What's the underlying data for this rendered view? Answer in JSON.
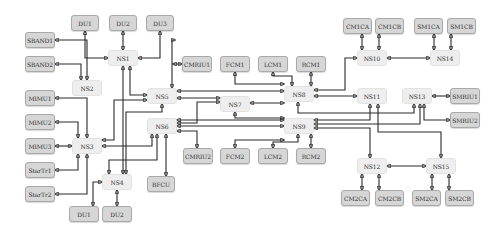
{
  "diagram": {
    "type": "network-topology",
    "nodes": {
      "du1_top": {
        "label": "DU1",
        "kind": "device",
        "x": 71,
        "y": 15,
        "w": 28,
        "h": 16
      },
      "du2_top": {
        "label": "DU2",
        "kind": "device",
        "x": 109,
        "y": 15,
        "w": 28,
        "h": 16
      },
      "du3": {
        "label": "DU3",
        "kind": "device",
        "x": 146,
        "y": 15,
        "w": 28,
        "h": 16
      },
      "sband1": {
        "label": "SBAND1",
        "kind": "device",
        "x": 25,
        "y": 32,
        "w": 30,
        "h": 16
      },
      "sband2": {
        "label": "SBAND2",
        "kind": "device",
        "x": 25,
        "y": 56,
        "w": 30,
        "h": 16
      },
      "ns1": {
        "label": "NS1",
        "kind": "switch",
        "x": 108,
        "y": 50,
        "w": 30,
        "h": 16
      },
      "ns2": {
        "label": "NS2",
        "kind": "switch",
        "x": 72,
        "y": 80,
        "w": 30,
        "h": 16
      },
      "mimu1": {
        "label": "MIMU1",
        "kind": "device",
        "x": 25,
        "y": 90,
        "w": 30,
        "h": 16
      },
      "mimu2": {
        "label": "MIMU2",
        "kind": "device",
        "x": 25,
        "y": 114,
        "w": 30,
        "h": 16
      },
      "mimu3": {
        "label": "MIMU3",
        "kind": "device",
        "x": 25,
        "y": 138,
        "w": 30,
        "h": 16
      },
      "startr1": {
        "label": "StarTr1",
        "kind": "device",
        "x": 25,
        "y": 162,
        "w": 30,
        "h": 16
      },
      "startr2": {
        "label": "StarTr2",
        "kind": "device",
        "x": 25,
        "y": 186,
        "w": 30,
        "h": 16
      },
      "ns3": {
        "label": "NS3",
        "kind": "switch",
        "x": 72,
        "y": 138,
        "w": 30,
        "h": 16
      },
      "ns4": {
        "label": "NS4",
        "kind": "switch",
        "x": 102,
        "y": 174,
        "w": 30,
        "h": 16
      },
      "du1_bot": {
        "label": "DU1",
        "kind": "device",
        "x": 69,
        "y": 206,
        "w": 30,
        "h": 16
      },
      "du2_bot": {
        "label": "DU2",
        "kind": "device",
        "x": 102,
        "y": 206,
        "w": 30,
        "h": 16
      },
      "bfcu": {
        "label": "BFCU",
        "kind": "device",
        "x": 147,
        "y": 176,
        "w": 28,
        "h": 16
      },
      "ns5": {
        "label": "NS5",
        "kind": "switch",
        "x": 147,
        "y": 88,
        "w": 30,
        "h": 16
      },
      "ns6": {
        "label": "NS6",
        "kind": "switch",
        "x": 147,
        "y": 118,
        "w": 30,
        "h": 16
      },
      "ns7": {
        "label": "NS7",
        "kind": "switch",
        "x": 220,
        "y": 96,
        "w": 30,
        "h": 16
      },
      "cmriu1": {
        "label": "CMRIU1",
        "kind": "device",
        "x": 182,
        "y": 56,
        "w": 30,
        "h": 16
      },
      "fcm1": {
        "label": "FCM1",
        "kind": "device",
        "x": 220,
        "y": 56,
        "w": 30,
        "h": 16
      },
      "lcm1": {
        "label": "LCM1",
        "kind": "device",
        "x": 258,
        "y": 56,
        "w": 30,
        "h": 16
      },
      "rcm1": {
        "label": "RCM1",
        "kind": "device",
        "x": 296,
        "y": 56,
        "w": 30,
        "h": 16
      },
      "ns8": {
        "label": "NS8",
        "kind": "switch",
        "x": 284,
        "y": 86,
        "w": 30,
        "h": 16
      },
      "ns9": {
        "label": "NS9",
        "kind": "switch",
        "x": 284,
        "y": 118,
        "w": 30,
        "h": 16
      },
      "cmriu2": {
        "label": "CMRIU2",
        "kind": "device",
        "x": 183,
        "y": 148,
        "w": 30,
        "h": 16
      },
      "fcm2": {
        "label": "FCM2",
        "kind": "device",
        "x": 220,
        "y": 148,
        "w": 30,
        "h": 16
      },
      "lcm2": {
        "label": "LCM2",
        "kind": "device",
        "x": 258,
        "y": 148,
        "w": 30,
        "h": 16
      },
      "rcm2": {
        "label": "RCM2",
        "kind": "device",
        "x": 296,
        "y": 148,
        "w": 30,
        "h": 16
      },
      "cm1ca": {
        "label": "CM1CA",
        "kind": "device",
        "x": 343,
        "y": 18,
        "w": 29,
        "h": 16
      },
      "cm1cb": {
        "label": "CM1CB",
        "kind": "device",
        "x": 375,
        "y": 18,
        "w": 29,
        "h": 16
      },
      "sm1ca": {
        "label": "SM1CA",
        "kind": "device",
        "x": 414,
        "y": 18,
        "w": 29,
        "h": 16
      },
      "sm1cb": {
        "label": "SM1CB",
        "kind": "device",
        "x": 447,
        "y": 18,
        "w": 29,
        "h": 16
      },
      "ns10": {
        "label": "NS10",
        "kind": "switch",
        "x": 357,
        "y": 50,
        "w": 30,
        "h": 16
      },
      "ns14": {
        "label": "NS14",
        "kind": "switch",
        "x": 430,
        "y": 50,
        "w": 30,
        "h": 16
      },
      "ns11": {
        "label": "NS11",
        "kind": "switch",
        "x": 357,
        "y": 88,
        "w": 30,
        "h": 16
      },
      "ns13": {
        "label": "NS13",
        "kind": "switch",
        "x": 402,
        "y": 88,
        "w": 30,
        "h": 16
      },
      "smriu1": {
        "label": "SMRIU1",
        "kind": "device",
        "x": 450,
        "y": 88,
        "w": 30,
        "h": 16
      },
      "smriu2": {
        "label": "SMRIU2",
        "kind": "device",
        "x": 450,
        "y": 112,
        "w": 30,
        "h": 16
      },
      "ns12": {
        "label": "NS12",
        "kind": "switch",
        "x": 357,
        "y": 158,
        "w": 30,
        "h": 16
      },
      "ns15": {
        "label": "NS15",
        "kind": "switch",
        "x": 426,
        "y": 158,
        "w": 30,
        "h": 16
      },
      "cm2ca": {
        "label": "CM2CA",
        "kind": "device",
        "x": 341,
        "y": 190,
        "w": 29,
        "h": 16
      },
      "cm2cb": {
        "label": "CM2CB",
        "kind": "device",
        "x": 375,
        "y": 190,
        "w": 29,
        "h": 16
      },
      "sm2ca": {
        "label": "SM2CA",
        "kind": "device",
        "x": 412,
        "y": 190,
        "w": 29,
        "h": 16
      },
      "sm2cb": {
        "label": "SM2CB",
        "kind": "device",
        "x": 445,
        "y": 190,
        "w": 29,
        "h": 16
      }
    },
    "links": [
      {
        "from": "ns1",
        "to": "du1_top",
        "d": "M108,58 H85 V31"
      },
      {
        "from": "ns1",
        "to": "du2_top",
        "d": "M123,50 V31"
      },
      {
        "from": "ns1",
        "to": "du3",
        "d": "M138,58 H160 V31"
      },
      {
        "from": "ns2",
        "to": "sband1",
        "d": "M87,80 V40 H55"
      },
      {
        "from": "ns2",
        "to": "sband2",
        "d": "M81,80 V64 H55"
      },
      {
        "from": "ns3",
        "to": "mimu1",
        "d": "M87,138 V98 H55"
      },
      {
        "from": "ns3",
        "to": "mimu2",
        "d": "M78,138 V122 H55"
      },
      {
        "from": "ns3",
        "to": "mimu3",
        "d": "M72,146 H55"
      },
      {
        "from": "ns3",
        "to": "startr1",
        "d": "M78,154 V170 H55"
      },
      {
        "from": "ns3",
        "to": "startr2",
        "d": "M87,154 V194 H55"
      },
      {
        "from": "ns4",
        "to": "du1_bot",
        "d": "M102,182 H93 V206"
      },
      {
        "from": "ns4",
        "to": "du2_bot",
        "d": "M117,190 V206"
      },
      {
        "from": "ns1",
        "to": "ns5",
        "d": "M130,66 V95 H147"
      },
      {
        "from": "ns1",
        "to": "ns4",
        "d": "M123,66 V174"
      },
      {
        "from": "ns5",
        "to": "ns3",
        "d": "M147,100 H114 V140 H102"
      },
      {
        "from": "ns5",
        "to": "ns8",
        "d": "M177,91 H284"
      },
      {
        "from": "ns5",
        "to": "ns4",
        "d": "M162,104 V112 H126 V174"
      },
      {
        "from": "ns5",
        "to": "du3",
        "d": "M172,88 V40 H175"
      },
      {
        "from": "ns5",
        "to": "ns7",
        "d": "M177,98 H220"
      },
      {
        "from": "ns6",
        "to": "ns3",
        "d": "M152,134 V146 H102"
      },
      {
        "from": "ns6",
        "to": "ns4",
        "d": "M157,134 V160 H109 V174"
      },
      {
        "from": "ns6",
        "to": "bfcu",
        "d": "M166,134 V176"
      },
      {
        "from": "ns6",
        "to": "cmriu2",
        "d": "M177,131 H197 V148"
      },
      {
        "from": "ns6",
        "to": "ns9",
        "d": "M177,120 H284"
      },
      {
        "from": "ns6",
        "to": "ns9b",
        "d": "M177,126 H284"
      },
      {
        "from": "ns7",
        "to": "ns6",
        "d": "M220,102 H197 V123 H177"
      },
      {
        "from": "ns7",
        "to": "ns8",
        "d": "M250,103 H284"
      },
      {
        "from": "ns7",
        "to": "ns9",
        "d": "M235,112 V118 H284"
      },
      {
        "from": "cmriu1",
        "to": "ns5",
        "d": "M182,64 H173"
      },
      {
        "from": "fcm1",
        "to": "ns8",
        "d": "M235,72 V84 H284"
      },
      {
        "from": "lcm1",
        "to": "ns8",
        "d": "M273,72 V76 H292 V86"
      },
      {
        "from": "rcm1",
        "to": "ns8",
        "d": "M311,72 V86"
      },
      {
        "from": "fcm2",
        "to": "ns9",
        "d": "M235,148 V140 H284"
      },
      {
        "from": "lcm2",
        "to": "ns9",
        "d": "M273,148 V142 H298 V134"
      },
      {
        "from": "rcm2",
        "to": "ns9",
        "d": "M311,148 V134"
      },
      {
        "from": "ns8",
        "to": "ns10",
        "d": "M314,90 H345 V58 H357"
      },
      {
        "from": "ns8",
        "to": "ns11",
        "d": "M314,96 H357"
      },
      {
        "from": "ns8",
        "to": "ns13",
        "d": "M298,102 V113 H414 V104"
      },
      {
        "from": "ns9",
        "to": "ns11",
        "d": "M314,120 H370 V104"
      },
      {
        "from": "ns9",
        "to": "ns13",
        "d": "M314,124 H420 V104"
      },
      {
        "from": "ns9",
        "to": "ns12",
        "d": "M314,128 H370 V158"
      },
      {
        "from": "ns11",
        "to": "ns15",
        "d": "M378,104 V132 H441 V158"
      },
      {
        "from": "ns13",
        "to": "smriu1",
        "d": "M432,96 H450"
      },
      {
        "from": "ns13",
        "to": "smriu2",
        "d": "M424,104 V120 H450"
      },
      {
        "from": "ns10",
        "to": "ns14",
        "d": "M387,58 H430"
      },
      {
        "from": "ns10",
        "to": "cm1ca",
        "d": "M362,50 V34"
      },
      {
        "from": "ns10",
        "to": "cm1cb",
        "d": "M379,50 V34"
      },
      {
        "from": "ns14",
        "to": "sm1ca",
        "d": "M434,50 V34"
      },
      {
        "from": "ns14",
        "to": "sm1cb",
        "d": "M451,50 V34"
      },
      {
        "from": "ns12",
        "to": "ns15",
        "d": "M387,166 H426"
      },
      {
        "from": "ns12",
        "to": "cm2ca",
        "d": "M362,174 V190"
      },
      {
        "from": "ns12",
        "to": "cm2cb",
        "d": "M379,174 V190"
      },
      {
        "from": "ns15",
        "to": "sm2ca",
        "d": "M432,174 V190"
      },
      {
        "from": "ns15",
        "to": "sm2cb",
        "d": "M449,174 V190"
      }
    ]
  }
}
